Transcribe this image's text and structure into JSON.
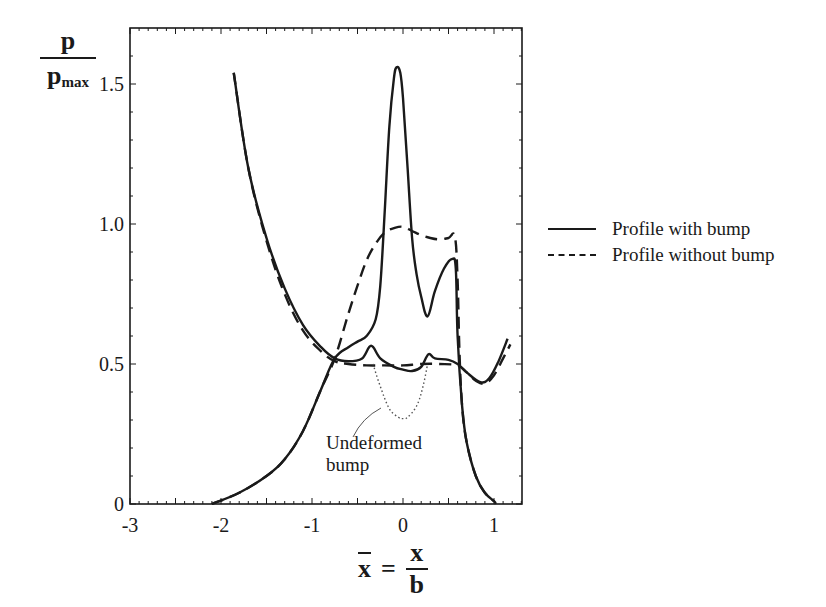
{
  "chart_data": {
    "type": "line",
    "title": "",
    "xlabel": "x̄ = x / b",
    "ylabel": "p / p_max",
    "xlim": [
      -3,
      1.32
    ],
    "ylim": [
      0,
      1.68
    ],
    "xticks": [
      "-3",
      "-2",
      "-1",
      "0",
      "1"
    ],
    "yticks": [
      "0",
      "0.5",
      "1.0",
      "1.5"
    ],
    "grid": false,
    "legend_position": "right",
    "series": [
      {
        "name": "Profile with bump",
        "style": "solid",
        "curve": "pressure",
        "x": [
          -2.1,
          -1.8,
          -1.5,
          -1.3,
          -1.1,
          -0.9,
          -0.75,
          -0.6,
          -0.5,
          -0.4,
          -0.3,
          -0.25,
          -0.2,
          -0.15,
          -0.1,
          -0.07,
          -0.03,
          0.0,
          0.05,
          0.1,
          0.15,
          0.2,
          0.27,
          0.35,
          0.45,
          0.54,
          0.58,
          0.6,
          0.65,
          0.7,
          0.8,
          0.9,
          1.0,
          1.02
        ],
        "y": [
          0.0,
          0.04,
          0.1,
          0.16,
          0.26,
          0.41,
          0.52,
          0.56,
          0.58,
          0.6,
          0.66,
          0.78,
          1.05,
          1.35,
          1.52,
          1.56,
          1.54,
          1.45,
          1.2,
          0.95,
          0.82,
          0.74,
          0.67,
          0.76,
          0.84,
          0.875,
          0.84,
          0.6,
          0.35,
          0.22,
          0.1,
          0.04,
          0.01,
          0.0
        ]
      },
      {
        "name": "Profile with bump",
        "style": "solid",
        "curve": "film thickness",
        "x": [
          -1.86,
          -1.7,
          -1.5,
          -1.3,
          -1.1,
          -0.9,
          -0.75,
          -0.6,
          -0.45,
          -0.35,
          -0.25,
          -0.1,
          0.0,
          0.1,
          0.2,
          0.28,
          0.35,
          0.5,
          0.6,
          0.7,
          0.85,
          0.95,
          1.05,
          1.15
        ],
        "y": [
          1.54,
          1.2,
          0.95,
          0.77,
          0.64,
          0.56,
          0.52,
          0.51,
          0.52,
          0.565,
          0.52,
          0.49,
          0.48,
          0.475,
          0.49,
          0.535,
          0.52,
          0.515,
          0.5,
          0.47,
          0.435,
          0.45,
          0.51,
          0.59
        ]
      },
      {
        "name": "Profile without bump",
        "style": "dashed",
        "curve": "pressure",
        "x": [
          -2.1,
          -1.8,
          -1.5,
          -1.3,
          -1.1,
          -0.9,
          -0.75,
          -0.6,
          -0.5,
          -0.4,
          -0.3,
          -0.2,
          -0.1,
          0.0,
          0.1,
          0.2,
          0.3,
          0.4,
          0.5,
          0.57,
          0.6,
          0.62,
          0.65,
          0.7,
          0.8,
          0.9,
          1.0
        ],
        "y": [
          0.0,
          0.04,
          0.1,
          0.16,
          0.26,
          0.41,
          0.52,
          0.68,
          0.78,
          0.87,
          0.93,
          0.97,
          0.985,
          0.99,
          0.975,
          0.96,
          0.95,
          0.945,
          0.95,
          0.955,
          0.8,
          0.55,
          0.35,
          0.22,
          0.1,
          0.04,
          0.01
        ]
      },
      {
        "name": "Profile without bump",
        "style": "dashed",
        "curve": "film thickness",
        "x": [
          -1.86,
          -1.7,
          -1.5,
          -1.3,
          -1.1,
          -0.9,
          -0.75,
          -0.6,
          -0.4,
          -0.2,
          0.0,
          0.2,
          0.4,
          0.6,
          0.7,
          0.8,
          0.9,
          1.0,
          1.1,
          1.18
        ],
        "y": [
          1.54,
          1.2,
          0.94,
          0.75,
          0.62,
          0.545,
          0.51,
          0.5,
          0.495,
          0.495,
          0.495,
          0.5,
          0.5,
          0.495,
          0.47,
          0.44,
          0.43,
          0.46,
          0.52,
          0.57
        ]
      },
      {
        "name": "Undeformed bump",
        "style": "dotted",
        "x": [
          -0.33,
          -0.25,
          -0.15,
          -0.05,
          0.0,
          0.05,
          0.15,
          0.22,
          0.27
        ],
        "y": [
          0.5,
          0.42,
          0.34,
          0.31,
          0.305,
          0.31,
          0.35,
          0.42,
          0.5
        ]
      }
    ],
    "annotations": [
      {
        "text": "Undeformed bump",
        "target_x": -0.02,
        "target_y": 0.34
      }
    ]
  },
  "axes": {
    "y_label_num": "p",
    "y_label_den": "p",
    "y_label_sub": "max",
    "x_label_var": "x",
    "x_label_eq": "=",
    "x_label_num": "x",
    "x_label_den": "b"
  },
  "legend": {
    "items": [
      {
        "label": "Profile with bump",
        "style": "solid"
      },
      {
        "label": "Profile without bump",
        "style": "dashed"
      }
    ]
  },
  "annotation": {
    "line1": "Undeformed",
    "line2": "bump"
  },
  "colors": {
    "ink": "#1a1a1a",
    "background": "#ffffff"
  }
}
